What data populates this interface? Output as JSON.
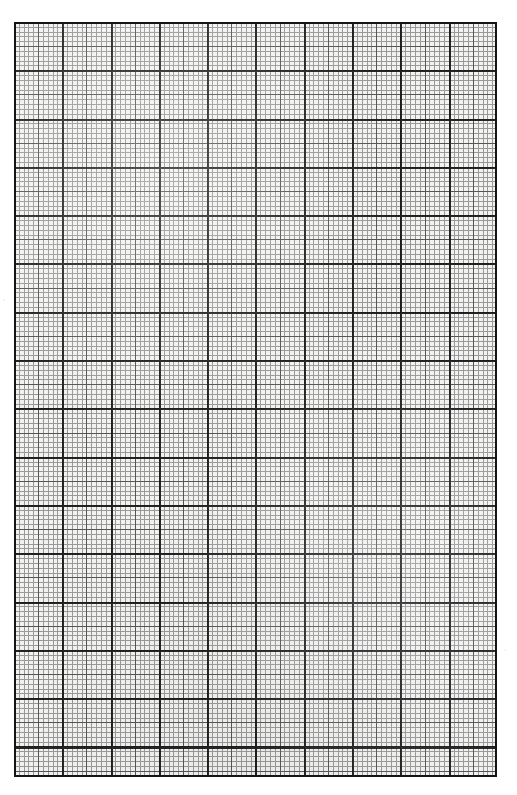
{
  "document": {
    "kind": "graph-paper-scan",
    "title": "",
    "page_background": "#ffffff",
    "page_width": 517,
    "page_height": 795
  },
  "grid": {
    "left": 14,
    "top": 22,
    "width": 483,
    "height": 755,
    "paper_tint": "#f2f2f0",
    "fine": {
      "pitch": 4.83,
      "color": "#8a8a8a",
      "thickness": 1,
      "columns": 100,
      "rows": 156
    },
    "medium": {
      "every": 5,
      "pitch": 24.15,
      "color": "#4a4a4a",
      "thickness": 1
    },
    "major": {
      "every": 10,
      "pitch": 48.3,
      "color": "#1c1c1c",
      "thickness": 2,
      "columns": 10,
      "rows": 15
    },
    "frame": {
      "color": "#141414",
      "thickness": 2
    }
  },
  "labels": {
    "axis_x": "",
    "axis_y": "",
    "caption": ""
  }
}
